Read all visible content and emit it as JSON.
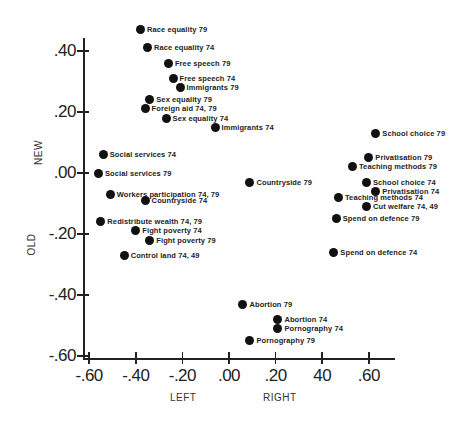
{
  "chart_data": {
    "type": "scatter",
    "title": "",
    "xlabel_left": "LEFT",
    "xlabel_right": "RIGHT",
    "ylabel_top": "NEW",
    "ylabel_bottom": "OLD",
    "xlim": [
      -0.6,
      0.7
    ],
    "ylim": [
      -0.6,
      0.48
    ],
    "grid": false,
    "x_ticks": [
      {
        "value": -0.6,
        "label": "-.60"
      },
      {
        "value": -0.4,
        "label": "-.40"
      },
      {
        "value": -0.2,
        "label": "-.20"
      },
      {
        "value": 0.0,
        "label": ".00"
      },
      {
        "value": 0.2,
        "label": ".20"
      },
      {
        "value": 0.4,
        "label": "40"
      },
      {
        "value": 0.6,
        "label": ".60"
      }
    ],
    "y_ticks": [
      {
        "value": 0.4,
        "label": ".40"
      },
      {
        "value": 0.2,
        "label": ".20"
      },
      {
        "value": 0.0,
        "label": ".00"
      },
      {
        "value": -0.2,
        "label": "-.20"
      },
      {
        "value": -0.4,
        "label": "-.40"
      },
      {
        "value": -0.6,
        "label": "-.60"
      }
    ],
    "points": [
      {
        "label": "Race equality  79",
        "x": -0.38,
        "y": 0.47
      },
      {
        "label": "Race equality  74",
        "x": -0.35,
        "y": 0.41
      },
      {
        "label": "Free speech  79",
        "x": -0.26,
        "y": 0.36
      },
      {
        "label": "Free speech  74",
        "x": -0.24,
        "y": 0.31
      },
      {
        "label": "Immigrants  79",
        "x": -0.21,
        "y": 0.28
      },
      {
        "label": "Sex equality  79",
        "x": -0.34,
        "y": 0.24
      },
      {
        "label": "Foreign aid  74, 79",
        "x": -0.36,
        "y": 0.21
      },
      {
        "label": "Sex equality  74",
        "x": -0.27,
        "y": 0.18
      },
      {
        "label": "Immigrants  74",
        "x": -0.06,
        "y": 0.15
      },
      {
        "label": "Social services  74",
        "x": -0.54,
        "y": 0.06
      },
      {
        "label": "Social services  79",
        "x": -0.56,
        "y": 0.0
      },
      {
        "label": "Workers participation  74, 79",
        "x": -0.51,
        "y": -0.07
      },
      {
        "label": "Countryside  74",
        "x": -0.36,
        "y": -0.09
      },
      {
        "label": "Redistribute wealth  74, 79",
        "x": -0.55,
        "y": -0.16
      },
      {
        "label": "Fight poverty  74",
        "x": -0.4,
        "y": -0.19
      },
      {
        "label": "Fight poverty  79",
        "x": -0.34,
        "y": -0.22
      },
      {
        "label": "Control land  74, 49",
        "x": -0.45,
        "y": -0.27
      },
      {
        "label": "Countryside  79",
        "x": 0.09,
        "y": -0.03
      },
      {
        "label": "School choice  79",
        "x": 0.63,
        "y": 0.13
      },
      {
        "label": "Privatisation  79",
        "x": 0.6,
        "y": 0.05
      },
      {
        "label": "Teaching methods  79",
        "x": 0.53,
        "y": 0.02
      },
      {
        "label": "School choice  74",
        "x": 0.59,
        "y": -0.03
      },
      {
        "label": "Privatisation  74",
        "x": 0.63,
        "y": -0.06
      },
      {
        "label": "Teaching methods  74",
        "x": 0.47,
        "y": -0.08
      },
      {
        "label": "Cut welfare  74, 49",
        "x": 0.59,
        "y": -0.11
      },
      {
        "label": "Spend on defence  79",
        "x": 0.46,
        "y": -0.15
      },
      {
        "label": "Spend on defence  74",
        "x": 0.45,
        "y": -0.26
      },
      {
        "label": "Abortion  79",
        "x": 0.06,
        "y": -0.43
      },
      {
        "label": "Abortion  74",
        "x": 0.21,
        "y": -0.48
      },
      {
        "label": "Pornography  74",
        "x": 0.21,
        "y": -0.51
      },
      {
        "label": "Pornography  79",
        "x": 0.09,
        "y": -0.55
      }
    ]
  },
  "layout_hints": {
    "origin_px": {
      "x": 229,
      "y": 173
    },
    "px_per_unit": {
      "x": 233,
      "y": 305
    }
  }
}
